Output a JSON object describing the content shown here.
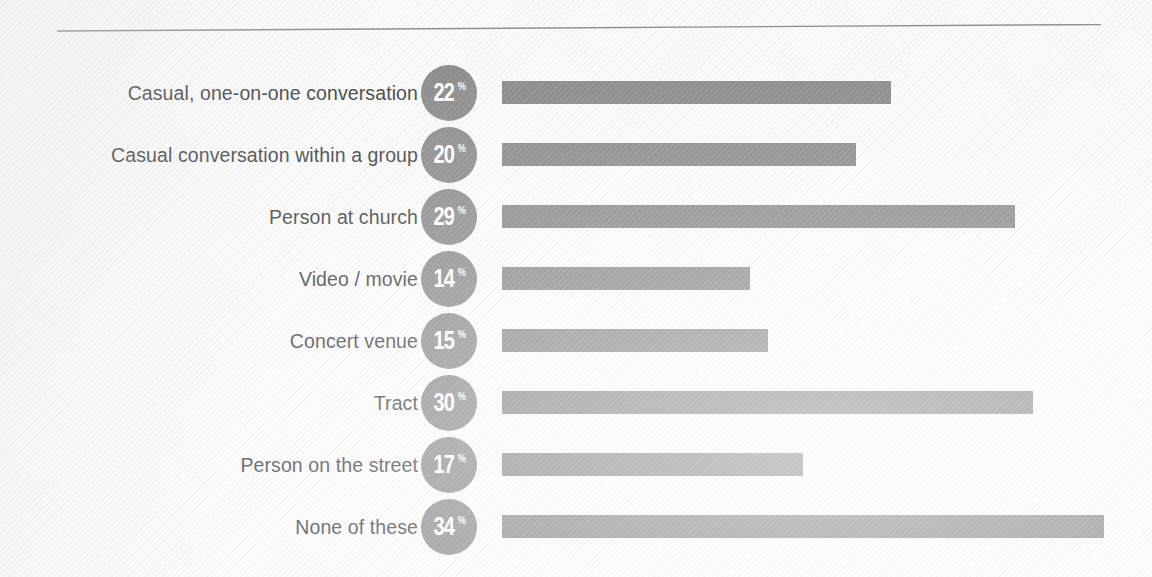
{
  "chart_data": {
    "type": "bar",
    "orientation": "horizontal",
    "title": "",
    "subtitle": "",
    "xlabel": "",
    "ylabel": "",
    "grid": false,
    "legend": null,
    "value_suffix": "%",
    "xlim": [
      0,
      36
    ],
    "categories": [
      "Casual, one-on-one conversation",
      "Casual conversation within a group",
      "Person at church",
      "Video / movie",
      "Concert venue",
      "Tract",
      "Person on the street",
      "None of these"
    ],
    "values": [
      22,
      20,
      29,
      14,
      15,
      30,
      17,
      34
    ],
    "rows": [
      {
        "label": "Casual, one-on-one conversation",
        "value": 22,
        "value_text": "22",
        "suffix": "%"
      },
      {
        "label": "Casual conversation within a group",
        "value": 20,
        "value_text": "20",
        "suffix": "%"
      },
      {
        "label": "Person at church",
        "value": 29,
        "value_text": "29",
        "suffix": "%"
      },
      {
        "label": "Video / movie",
        "value": 14,
        "value_text": "14",
        "suffix": "%"
      },
      {
        "label": "Concert venue",
        "value": 15,
        "value_text": "15",
        "suffix": "%"
      },
      {
        "label": "Tract",
        "value": 30,
        "value_text": "30",
        "suffix": "%"
      },
      {
        "label": "Person on the street",
        "value": 17,
        "value_text": "17",
        "suffix": "%"
      },
      {
        "label": "None of these",
        "value": 34,
        "value_text": "34",
        "suffix": "%"
      }
    ],
    "colors": {
      "bar": "#8a8a8a",
      "badge": "#8d8d8d",
      "badge_text": "#ffffff",
      "label_text": "#4b4b4d",
      "background": "#fbfbfb",
      "rule": "#8f8f93"
    }
  },
  "layout": {
    "bar_origin_x": 502,
    "px_per_unit": 17.7,
    "row_pitch": 62,
    "first_row_top": 62,
    "bar_height": 23,
    "badge_diameter": 56
  }
}
